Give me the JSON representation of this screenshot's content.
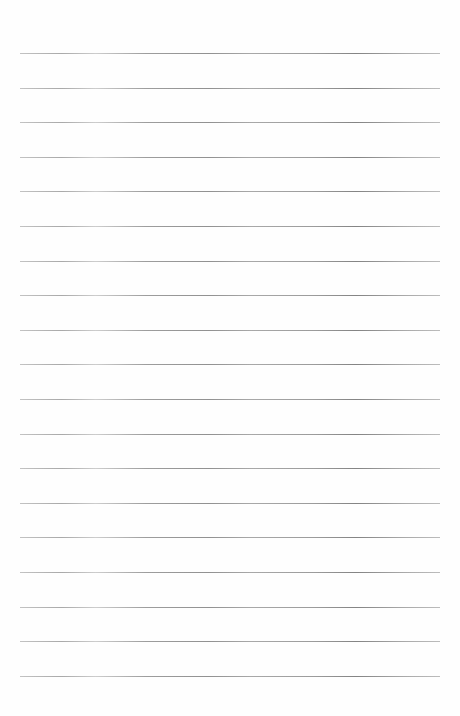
{
  "page": {
    "type": "blank lined paper",
    "background_color": "#fefefe",
    "rule_color": "#8c8c8c",
    "rule_count": 19,
    "first_rule_y": 53,
    "rule_spacing": 34.6,
    "rule_left": 20,
    "rule_width": 420
  }
}
